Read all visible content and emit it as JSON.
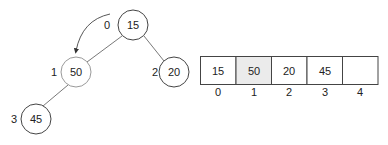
{
  "diagram": {
    "title": "",
    "tree": {
      "nodes": [
        {
          "index": "0",
          "value": "15",
          "highlight": false
        },
        {
          "index": "1",
          "value": "50",
          "highlight": true
        },
        {
          "index": "2",
          "value": "20",
          "highlight": false
        },
        {
          "index": "3",
          "value": "45",
          "highlight": false
        }
      ],
      "edges": [
        {
          "from": "0",
          "to": "1"
        },
        {
          "from": "0",
          "to": "2"
        },
        {
          "from": "1",
          "to": "3"
        }
      ],
      "arrow": {
        "from": "0",
        "to": "1",
        "description": "curved arrow pointing from node 0 to node 1"
      }
    },
    "array": {
      "cells": [
        {
          "index": "0",
          "value": "15",
          "highlight": false
        },
        {
          "index": "1",
          "value": "50",
          "highlight": true
        },
        {
          "index": "2",
          "value": "20",
          "highlight": false
        },
        {
          "index": "3",
          "value": "45",
          "highlight": false
        },
        {
          "index": "4",
          "value": "",
          "highlight": false
        }
      ]
    }
  }
}
